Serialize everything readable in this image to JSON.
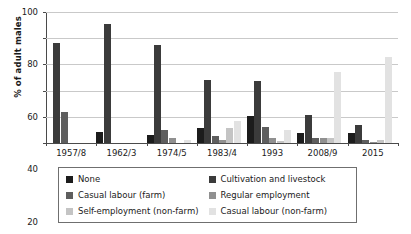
{
  "chart_data": {
    "type": "bar",
    "title": "",
    "subtitle": "",
    "xlabel": "",
    "ylabel": "% of adult males",
    "ylim": [
      0,
      100
    ],
    "yticks": [
      0,
      20,
      40,
      60,
      80,
      100
    ],
    "ytick_labels": [
      "0",
      "20",
      "40",
      "60",
      "80",
      "100"
    ],
    "grid": "horizontal",
    "legend_position": "bottom",
    "categories": [
      "1957/8",
      "1962/3",
      "1974/5",
      "1983/4",
      "1993",
      "2008/9",
      "2015"
    ],
    "series": [
      {
        "name": "None",
        "color": "#1c1c1c",
        "values": [
          0,
          8.5,
          6.5,
          11.5,
          21,
          8,
          8
        ]
      },
      {
        "name": "Cultivation and livestock",
        "color": "#3b3b3b",
        "values": [
          76,
          91,
          74.5,
          48,
          47,
          21.5,
          14
        ]
      },
      {
        "name": "Casual labour (farm)",
        "color": "#5e5e5e",
        "values": [
          23.5,
          0,
          10,
          5.5,
          12.5,
          3.5,
          2.5
        ]
      },
      {
        "name": "Regular employment",
        "color": "#909090",
        "values": [
          0,
          0,
          3.5,
          2.5,
          3.5,
          4,
          0.5
        ]
      },
      {
        "name": "Self-employment (non-farm)",
        "color": "#c4c4c4",
        "values": [
          0,
          0,
          0,
          11.5,
          1.5,
          4,
          2
        ]
      },
      {
        "name": "Casual labour (non-farm)",
        "color": "#e2e2e2",
        "values": [
          0,
          0,
          2.5,
          17,
          10,
          54,
          66
        ]
      }
    ]
  },
  "legend": {
    "entries": [
      {
        "label": "None",
        "color": "#1c1c1c"
      },
      {
        "label": "Cultivation and livestock",
        "color": "#3b3b3b"
      },
      {
        "label": "Casual labour (farm)",
        "color": "#5e5e5e"
      },
      {
        "label": "Regular employment",
        "color": "#909090"
      },
      {
        "label": "Self-employment (non-farm)",
        "color": "#c4c4c4"
      },
      {
        "label": "Casual labour (non-farm)",
        "color": "#e2e2e2"
      }
    ]
  },
  "axis": {
    "y_title": "% of adult males",
    "y_tick_labels": [
      "100",
      "80",
      "60",
      "40",
      "20",
      "0"
    ],
    "x_tick_labels": [
      "1957/8",
      "1962/3",
      "1974/5",
      "1983/4",
      "1993",
      "2008/9",
      "2015"
    ]
  },
  "colors": {
    "axis": "#4a4a4a",
    "gridline": "#c9c9c9",
    "legend_border": "#6f6f6f",
    "background": "#ffffff"
  }
}
